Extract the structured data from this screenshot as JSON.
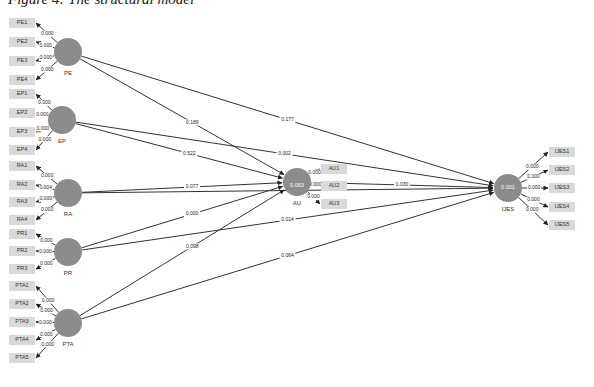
{
  "title": "Figure 4: The structural model",
  "latents": [
    {
      "id": "PE",
      "label": "PE",
      "value": ""
    },
    {
      "id": "EP",
      "label": "EP",
      "value": ""
    },
    {
      "id": "RA",
      "label": "RA",
      "value": ""
    },
    {
      "id": "PR",
      "label": "PR",
      "value": ""
    },
    {
      "id": "PTA",
      "label": "PTA",
      "value": ""
    },
    {
      "id": "AU",
      "label": "AU",
      "value": "0.063"
    },
    {
      "id": "IJES",
      "label": "IJES",
      "value": "0.001"
    }
  ],
  "indicators": [
    {
      "label": "PE1",
      "latent": "PE",
      "loading": "0.000"
    },
    {
      "label": "PE2",
      "latent": "PE",
      "loading": "0.000"
    },
    {
      "label": "PE3",
      "latent": "PE",
      "loading": "0.000"
    },
    {
      "label": "PE4",
      "latent": "PE",
      "loading": "0.000"
    },
    {
      "label": "EP1",
      "latent": "EP",
      "loading": "0.000"
    },
    {
      "label": "EP2",
      "latent": "EP",
      "loading": "0.000"
    },
    {
      "label": "EP3",
      "latent": "EP",
      "loading": "0.000"
    },
    {
      "label": "EP4",
      "latent": "EP",
      "loading": "0.000"
    },
    {
      "label": "RA1",
      "latent": "RA",
      "loading": "0.000"
    },
    {
      "label": "RA2",
      "latent": "RA",
      "loading": "0.004"
    },
    {
      "label": "RA3",
      "latent": "RA",
      "loading": "0.000"
    },
    {
      "label": "RA4",
      "latent": "RA",
      "loading": "0.000"
    },
    {
      "label": "PR1",
      "latent": "PR",
      "loading": "0.000"
    },
    {
      "label": "PR2",
      "latent": "PR",
      "loading": "0.000"
    },
    {
      "label": "PR3",
      "latent": "PR",
      "loading": "0.000"
    },
    {
      "label": "PTA1",
      "latent": "PTA",
      "loading": "0.000"
    },
    {
      "label": "PTA2",
      "latent": "PTA",
      "loading": "0.000"
    },
    {
      "label": "PTA3",
      "latent": "PTA",
      "loading": "0.000"
    },
    {
      "label": "PTA4",
      "latent": "PTA",
      "loading": "0.000"
    },
    {
      "label": "PTA5",
      "latent": "PTA",
      "loading": "0.000"
    },
    {
      "label": "AU1",
      "latent": "AU",
      "loading": "0.000"
    },
    {
      "label": "AU2",
      "latent": "AU",
      "loading": "0.000"
    },
    {
      "label": "AU3",
      "latent": "AU",
      "loading": "0.000"
    },
    {
      "label": "IJES1",
      "latent": "IJES",
      "loading": "0.000"
    },
    {
      "label": "IJES2",
      "latent": "IJES",
      "loading": "0.000"
    },
    {
      "label": "IJES3",
      "latent": "IJES",
      "loading": "0.000"
    },
    {
      "label": "IJES4",
      "latent": "IJES",
      "loading": "0.000"
    },
    {
      "label": "IJES5",
      "latent": "IJES",
      "loading": "0.000"
    }
  ],
  "paths": [
    {
      "from": "PE",
      "to": "AU",
      "value": "0.189"
    },
    {
      "from": "PE",
      "to": "IJES",
      "value": "0.177"
    },
    {
      "from": "EP",
      "to": "AU",
      "value": "0.522"
    },
    {
      "from": "EP",
      "to": "IJES",
      "value": "0.002"
    },
    {
      "from": "RA",
      "to": "AU",
      "value": "0.077"
    },
    {
      "from": "RA",
      "to": "IJES",
      "value": ""
    },
    {
      "from": "PR",
      "to": "AU",
      "value": "0.000"
    },
    {
      "from": "PR",
      "to": "IJES",
      "value": "0.014"
    },
    {
      "from": "PTA",
      "to": "AU",
      "value": "0.098"
    },
    {
      "from": "PTA",
      "to": "IJES",
      "value": "0.064"
    },
    {
      "from": "AU",
      "to": "IJES",
      "value": "0.030"
    }
  ]
}
